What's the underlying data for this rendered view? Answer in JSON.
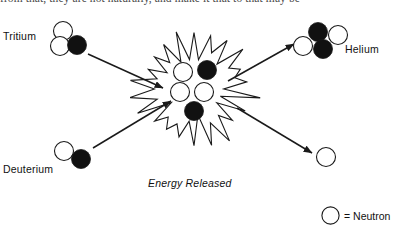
{
  "figure": {
    "top_text_fragment": "from that, they are not naturally, and make it that to that may be",
    "background_color": "#ffffff",
    "stroke_color": "#1a1a1a",
    "neutron_fill": "#ffffff",
    "proton_fill": "#111111"
  },
  "labels": {
    "tritium": "Tritium",
    "deuterium": "Deuterium",
    "helium": "Helium",
    "energy_released": "Energy Released"
  },
  "legend": {
    "symbol": "open-circle",
    "text": "= Neutron"
  },
  "particles": {
    "tritium": [
      {
        "name": "neutron",
        "type": "open",
        "cx": 63,
        "cy": 31,
        "r": 9.5
      },
      {
        "name": "neutron",
        "type": "open",
        "cx": 60,
        "cy": 46,
        "r": 9.5
      },
      {
        "name": "proton",
        "type": "filled",
        "cx": 77,
        "cy": 45,
        "r": 9.5
      }
    ],
    "deuterium": [
      {
        "name": "neutron",
        "type": "open",
        "cx": 64,
        "cy": 151,
        "r": 9.5
      },
      {
        "name": "proton",
        "type": "filled",
        "cx": 81,
        "cy": 159,
        "r": 9.5
      }
    ],
    "fusion_core": [
      {
        "name": "neutron",
        "type": "open",
        "cx": 183,
        "cy": 72,
        "r": 9.5
      },
      {
        "name": "proton",
        "type": "filled",
        "cx": 207,
        "cy": 70,
        "r": 9.5
      },
      {
        "name": "neutron",
        "type": "open",
        "cx": 180,
        "cy": 92,
        "r": 9.5
      },
      {
        "name": "neutron",
        "type": "open",
        "cx": 204,
        "cy": 92,
        "r": 9.5
      },
      {
        "name": "proton",
        "type": "filled",
        "cx": 194,
        "cy": 111,
        "r": 9.5
      }
    ],
    "helium": [
      {
        "name": "proton",
        "type": "filled",
        "cx": 318,
        "cy": 32,
        "r": 9.5
      },
      {
        "name": "neutron",
        "type": "open",
        "cx": 338,
        "cy": 35,
        "r": 9.5
      },
      {
        "name": "neutron",
        "type": "open",
        "cx": 303,
        "cy": 46,
        "r": 9.5
      },
      {
        "name": "proton",
        "type": "filled",
        "cx": 323,
        "cy": 49,
        "r": 9.5
      }
    ],
    "free_neutron": [
      {
        "name": "neutron",
        "type": "open",
        "cx": 326,
        "cy": 157,
        "r": 9.5
      }
    ]
  },
  "arrows": [
    {
      "name": "tritium-to-core",
      "x1": 88,
      "y1": 54,
      "x2": 163,
      "y2": 88
    },
    {
      "name": "deuterium-to-core",
      "x1": 93,
      "y1": 148,
      "x2": 171,
      "y2": 101
    },
    {
      "name": "core-to-helium",
      "x1": 228,
      "y1": 81,
      "x2": 294,
      "y2": 44
    },
    {
      "name": "core-to-neutron",
      "x1": 237,
      "y1": 108,
      "x2": 312,
      "y2": 153
    }
  ],
  "burst": {
    "name": "energy-burst-starburst",
    "cx": 194,
    "cy": 89,
    "outer_r": 62,
    "inner_r": 38,
    "spikes": 22
  }
}
